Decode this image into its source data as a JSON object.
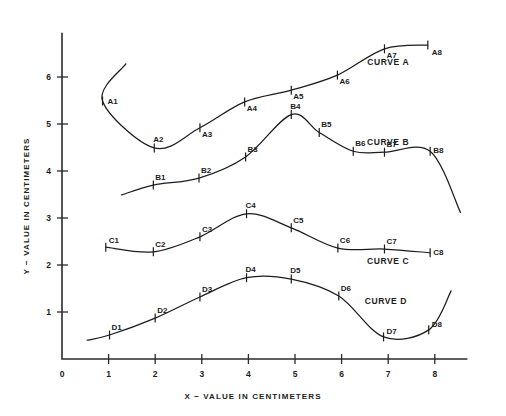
{
  "chart_data": {
    "type": "line",
    "title": "",
    "xlabel": "X − VALUE IN CENTIMETERS",
    "ylabel": "Y − VALUE IN CENTIMETERS",
    "xlim": [
      0,
      8.7
    ],
    "ylim": [
      0,
      6.9
    ],
    "xticks": [
      "0",
      "1",
      "2",
      "3",
      "4",
      "5",
      "6",
      "7",
      "8"
    ],
    "xtick_values": [
      0,
      1,
      2,
      3,
      4,
      5,
      6,
      7,
      8
    ],
    "yticks": [
      "1",
      "2",
      "3",
      "4",
      "5",
      "6"
    ],
    "ytick_values": [
      1,
      2,
      3,
      4,
      5,
      6
    ],
    "grid": false,
    "legend": "inline-curve-labels",
    "line_color": "#1c1c1c",
    "axis_color": "#2b2b2b",
    "series": [
      {
        "name": "CURVE A",
        "label": "CURVE A",
        "label_x": 7.0,
        "label_y": 6.25,
        "point_labels": [
          "A1",
          "A2",
          "A3",
          "A4",
          "A5",
          "A6",
          "A7",
          "A8"
        ],
        "x": [
          0.87,
          1.98,
          2.96,
          3.92,
          4.92,
          5.91,
          6.92,
          7.85
        ],
        "y": [
          5.49,
          4.49,
          4.92,
          5.47,
          5.72,
          6.04,
          6.6,
          6.68
        ],
        "extend_start": {
          "x": 1.37,
          "y": 6.28
        },
        "extend_end": null
      },
      {
        "name": "CURVE B",
        "label": "CURVE B",
        "label_x": 7.0,
        "label_y": 4.55,
        "point_labels": [
          "B1",
          "B2",
          "B3",
          "B4",
          "B5",
          "B6",
          "B7",
          "B8"
        ],
        "x": [
          1.96,
          2.94,
          3.94,
          4.92,
          5.52,
          6.25,
          6.92,
          7.9
        ],
        "y": [
          3.7,
          3.85,
          4.3,
          5.2,
          4.82,
          4.42,
          4.4,
          4.42
        ],
        "extend_start": {
          "x": 1.28,
          "y": 3.49
        },
        "extend_end": {
          "x": 8.55,
          "y": 3.12
        }
      },
      {
        "name": "CURVE C",
        "label": "CURVE C",
        "label_x": 7.0,
        "label_y": 2.02,
        "point_labels": [
          "C1",
          "C2",
          "C3",
          "C4",
          "C5",
          "C6",
          "C7",
          "C8"
        ],
        "x": [
          0.94,
          1.96,
          2.96,
          3.96,
          4.92,
          5.92,
          6.92,
          7.9
        ],
        "y": [
          2.38,
          2.28,
          2.6,
          3.09,
          2.79,
          2.36,
          2.34,
          2.26
        ],
        "extend_start": null,
        "extend_end": null
      },
      {
        "name": "CURVE D",
        "label": "CURVE D",
        "label_x": 6.95,
        "label_y": 1.16,
        "point_labels": [
          "D1",
          "D2",
          "D3",
          "D4",
          "D5",
          "D6",
          "D7",
          "D8"
        ],
        "x": [
          1.02,
          2.0,
          2.96,
          3.96,
          4.92,
          5.94,
          6.9,
          7.87
        ],
        "y": [
          0.51,
          0.87,
          1.32,
          1.73,
          1.7,
          1.34,
          0.47,
          0.62
        ],
        "extend_start": {
          "x": 0.54,
          "y": 0.4
        },
        "extend_end": {
          "x": 8.35,
          "y": 1.45
        }
      }
    ]
  },
  "axes": {
    "x_title": "X − VALUE IN CENTIMETERS",
    "y_title": "Y − VALUE IN CENTIMETERS",
    "origin_label": "0"
  }
}
